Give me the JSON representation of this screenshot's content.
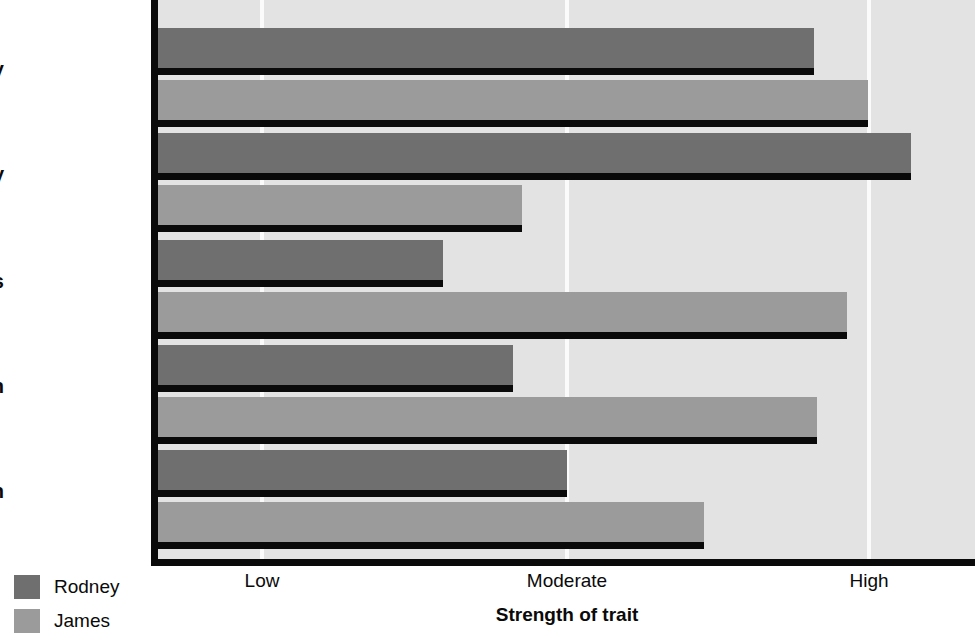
{
  "chart_data": {
    "type": "bar",
    "orientation": "horizontal",
    "title": "",
    "xlabel": "Strength of trait",
    "ylabel": "",
    "categories": [
      "Industry",
      "Generosity",
      "Nervousness",
      "Extraversion",
      "Aggression"
    ],
    "tick_labels": [
      "Low",
      "Moderate",
      "High"
    ],
    "tick_values": [
      1,
      2,
      3
    ],
    "xlim": [
      0,
      3.05
    ],
    "grid": true,
    "legend_position": "bottom-left",
    "series": [
      {
        "name": "Rodney",
        "color": "#6f6f6f",
        "values": [
          2.16,
          2.48,
          0.94,
          1.17,
          1.35
        ]
      },
      {
        "name": "James",
        "color": "#9b9b9b",
        "values": [
          2.34,
          1.2,
          2.27,
          2.17,
          1.8
        ]
      }
    ]
  },
  "axis": {
    "x_title": "Strength of trait",
    "ticks": [
      {
        "label": "Low",
        "x": 262
      },
      {
        "label": "Moderate",
        "x": 567
      },
      {
        "label": "High",
        "x": 869
      }
    ]
  },
  "legend": {
    "items": [
      {
        "label": "Rodney",
        "color": "#6f6f6f",
        "swatch": "rodney"
      },
      {
        "label": "James",
        "color": "#9b9b9b",
        "swatch": "james"
      }
    ]
  },
  "colors": {
    "plot_background": "#e3e3e3",
    "gridline": "#fbfbfb",
    "axis": "#0a0a0a",
    "series_rodney": "#6f6f6f",
    "series_james": "#9b9b9b"
  },
  "geometry": {
    "axis_x": 157,
    "plot_right": 975,
    "plot_bottom": 562,
    "unit_px": 304,
    "group_tops": [
      28,
      133,
      240,
      345,
      450
    ],
    "bar_height": 40,
    "bar_gap": 12,
    "label_tops": [
      58,
      163,
      270,
      375,
      480
    ]
  }
}
